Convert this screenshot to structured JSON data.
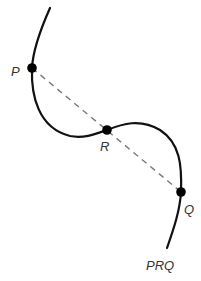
{
  "diagram": {
    "type": "curve-with-chord",
    "colors": {
      "curve": "#111111",
      "chord": "#777777",
      "point": "#000000",
      "label": "#333333",
      "background": "#ffffff"
    },
    "points": [
      {
        "id": "P",
        "label": "P",
        "x": 32,
        "y": 68
      },
      {
        "id": "R",
        "label": "R",
        "x": 107,
        "y": 130
      },
      {
        "id": "Q",
        "label": "Q",
        "x": 181,
        "y": 192
      }
    ],
    "chord": {
      "from": "P",
      "to": "Q",
      "style": "dashed"
    },
    "curve_label": "PRQ"
  }
}
